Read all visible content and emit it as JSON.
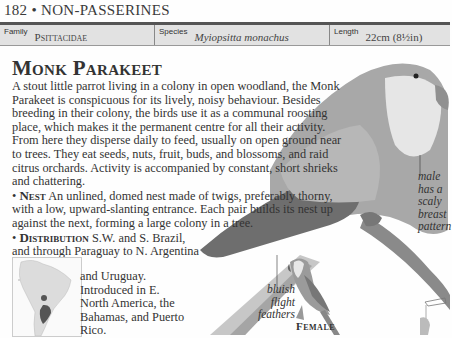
{
  "running_head": {
    "page_number": "182",
    "separator": "•",
    "section": "NON-PASSERINES"
  },
  "facts": {
    "family_label": "Family",
    "family_value": "Psittacidae",
    "species_label": "Species",
    "species_value": "Myiopsitta monachus",
    "length_label": "Length",
    "length_value": "22cm (8½in)"
  },
  "title": "Monk Parakeet",
  "intro": "A stout little parrot living in a colony in open woodland, the Monk Parakeet is conspicuous for its lively, noisy behaviour. Besides breeding in their colony, the birds use it as a communal roosting place, which makes it the permanent centre for all their activity. From here they disperse daily to feed, usually on open ground near to trees. They eat seeds, nuts, fruit, buds, and blossoms, and raid citrus orchards. Activity is accompanied by constant, short shrieks and chattering.",
  "nest": {
    "bullet": "•",
    "heading": "Nest",
    "text": "An unlined, domed nest made of twigs, preferably thorny, with a low, upward-slanting entrance. Each pair builds its nest up against the next, forming a large colony in a tree."
  },
  "distribution": {
    "bullet": "•",
    "heading": "Distribution",
    "text_line1": "S.W. and S. Brazil,",
    "text_line2": "and through Paraguay to N. Argentina",
    "text_rest": "and Uruguay. Introduced in E. North America, the Bahamas, and Puerto Rico."
  },
  "annotations": {
    "male": "male has a scaly breast pattern",
    "bluish": "bluish flight feathers",
    "female_caption": "Female"
  },
  "colors": {
    "fact_bar": "#e2e2e2",
    "rule": "#555555",
    "text": "#333333",
    "map_range": "#555555",
    "map_land": "#dcdcdc"
  },
  "icons": {
    "map": "south-america-range-map-icon",
    "flight": "flight-silhouette-icon"
  }
}
